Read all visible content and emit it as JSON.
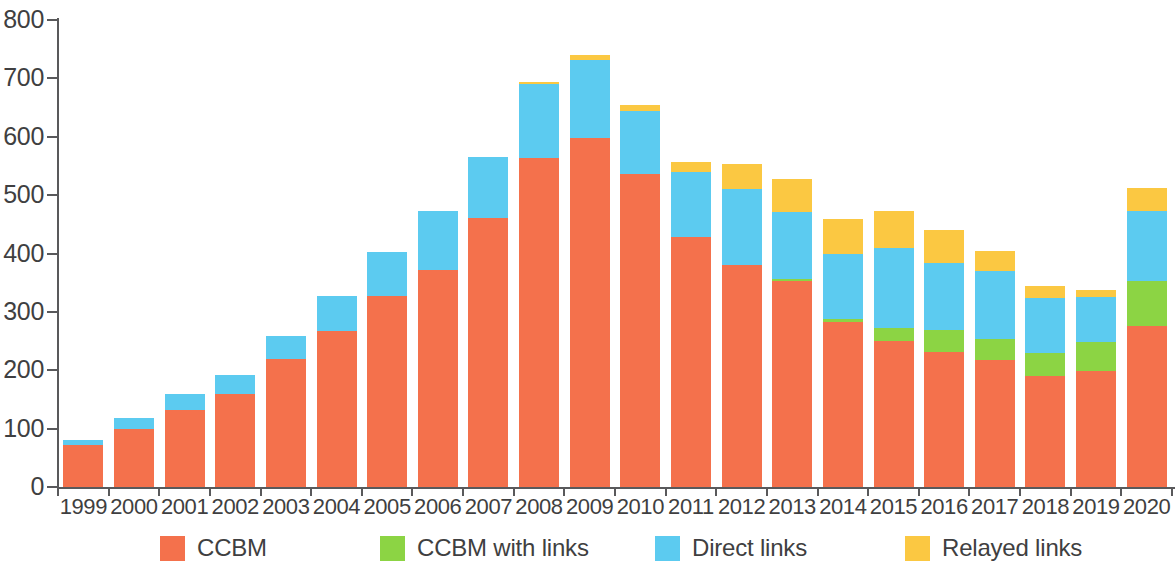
{
  "chart_data": {
    "type": "bar",
    "subtype": "stacked-bar",
    "title": "",
    "xlabel": "",
    "ylabel": "",
    "ylim": [
      0,
      800
    ],
    "ytick_values": [
      0,
      100,
      200,
      300,
      400,
      500,
      600,
      700,
      800
    ],
    "ytick_labels": [
      "0",
      "100",
      "200",
      "300",
      "400",
      "500",
      "600",
      "700",
      "800"
    ],
    "grid": false,
    "legend_position": "bottom",
    "categories": [
      "1999",
      "2000",
      "2001",
      "2002",
      "2003",
      "2004",
      "2005",
      "2006",
      "2007",
      "2008",
      "2009",
      "2010",
      "2011",
      "2012",
      "2013",
      "2014",
      "2015",
      "2016",
      "2017",
      "2018",
      "2019",
      "2020"
    ],
    "series": [
      {
        "name": "CCBM",
        "color": "#F4714C",
        "values": [
          72,
          100,
          132,
          160,
          220,
          267,
          327,
          372,
          460,
          563,
          598,
          536,
          428,
          380,
          353,
          283,
          250,
          231,
          217,
          190,
          198,
          275
        ]
      },
      {
        "name": "CCBM with links",
        "color": "#8CD444",
        "values": [
          0,
          0,
          0,
          0,
          0,
          0,
          0,
          0,
          0,
          0,
          0,
          0,
          0,
          0,
          4,
          5,
          22,
          38,
          36,
          40,
          50,
          78
        ]
      },
      {
        "name": "Direct links",
        "color": "#5CCBF0",
        "values": [
          8,
          18,
          28,
          32,
          39,
          61,
          75,
          100,
          106,
          127,
          133,
          108,
          112,
          131,
          114,
          112,
          137,
          115,
          117,
          93,
          77,
          120
        ]
      },
      {
        "name": "Relayed links",
        "color": "#FBC842",
        "values": [
          0,
          0,
          0,
          0,
          0,
          0,
          0,
          0,
          0,
          4,
          9,
          11,
          16,
          42,
          56,
          60,
          64,
          56,
          35,
          22,
          13,
          40
        ]
      }
    ],
    "totals": [
      80,
      118,
      160,
      192,
      259,
      328,
      402,
      472,
      566,
      694,
      740,
      655,
      556,
      553,
      527,
      460,
      473,
      440,
      405,
      345,
      338,
      513
    ],
    "legend": [
      {
        "label": "CCBM",
        "color": "#F4714C"
      },
      {
        "label": "CCBM with links",
        "color": "#8CD444"
      },
      {
        "label": "Direct links",
        "color": "#5CCBF0"
      },
      {
        "label": "Relayed links",
        "color": "#FBC842"
      }
    ],
    "axis_color": "#59595B",
    "text_color": "#3F3F41",
    "background": "#FFFFFF"
  },
  "legend_x_positions": [
    160,
    380,
    655,
    905
  ]
}
